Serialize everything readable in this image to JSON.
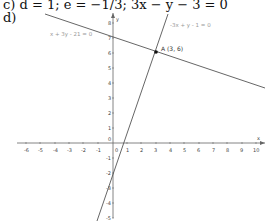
{
  "heading": {
    "part_c": "c) d = 1; e = −1/3; 3x − y − 3 = 0",
    "part_d": "d)"
  },
  "graph": {
    "line1_equation": "x + 3y - 21 = 0",
    "line2_equation": "-3x + y - 1 = 0",
    "intersection_label": "A  (3, 6)",
    "x_axis_label": "x",
    "y_axis_label": "y",
    "x_ticks": [
      "-6",
      "-5",
      "-4",
      "-3",
      "-2",
      "-1",
      "0",
      "1",
      "2",
      "3",
      "4",
      "5",
      "6",
      "7",
      "8",
      "9",
      "10"
    ],
    "y_ticks": [
      "8",
      "7",
      "6",
      "5",
      "4",
      "3",
      "2",
      "1",
      "0",
      "-1",
      "-2",
      "-3",
      "-4",
      "-5"
    ]
  }
}
